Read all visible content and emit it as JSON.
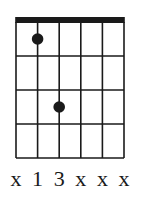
{
  "chart": {
    "type": "guitar-chord-diagram",
    "strings": 6,
    "frets": 4,
    "nut": true,
    "fingers": [
      {
        "string": 2,
        "fret": 1
      },
      {
        "string": 3,
        "fret": 3
      }
    ],
    "string_labels": [
      "x",
      "1",
      "3",
      "x",
      "x",
      "x"
    ],
    "colors": {
      "line": "#1a1a1a",
      "nut": "#1a1a1a",
      "dot": "#1a1a1a",
      "background": "#ffffff"
    }
  }
}
